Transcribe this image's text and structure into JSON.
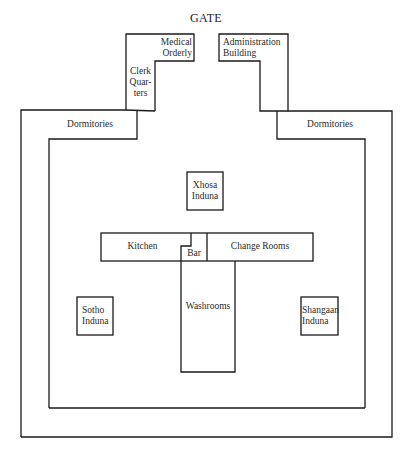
{
  "diagram": {
    "title": "GATE",
    "rooms": {
      "medical_orderly": [
        "Medical",
        "Orderly"
      ],
      "clerk_quarters": [
        "Clerk",
        "Quar-",
        "ters"
      ],
      "administration_building": [
        "Administration",
        "Building"
      ],
      "dormitories_left": "Dormitories",
      "dormitories_right": "Dormitories",
      "xhosa_induna": [
        "Xhosa",
        "Induna"
      ],
      "kitchen": "Kitchen",
      "bar": "Bar",
      "change_rooms": "Change Rooms",
      "washrooms": "Washrooms",
      "sotho_induna": [
        "Sotho",
        "Induna"
      ],
      "shangaan_induna": [
        "Shangaan",
        "Induna"
      ]
    },
    "colors": {
      "line": "#1a1a1a",
      "background": "#ffffff",
      "text": "#2a2a2a"
    }
  }
}
